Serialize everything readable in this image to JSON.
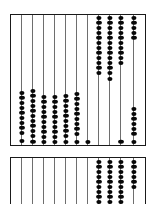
{
  "figure": {
    "instrument": "abacus",
    "ink_color": "#080808",
    "rod_color": "#6e6e6e",
    "frame_color": "#1a1a1a",
    "background_color": "#ffffff",
    "panel_count": 2,
    "rods_per_panel": 11
  },
  "panels": [
    {
      "name": "upper-abacus-frame",
      "label": "Upper abacus frame",
      "x": 10,
      "y": 14,
      "width": 136,
      "height": 132,
      "rod_count": 11,
      "rod_x": [
        20,
        31,
        42,
        53,
        64,
        75,
        86,
        97,
        108,
        119,
        132
      ],
      "rods": [
        {
          "index": 1,
          "bead_count": 10,
          "group": "lower",
          "beads_y": [
            92,
            97,
            102,
            107,
            112,
            117,
            122,
            127,
            132,
            140
          ]
        },
        {
          "index": 2,
          "bead_count": 11,
          "group": "lower",
          "beads_y": [
            90,
            95,
            100,
            105,
            110,
            115,
            120,
            125,
            130,
            135,
            141
          ]
        },
        {
          "index": 3,
          "bead_count": 10,
          "group": "lower",
          "beads_y": [
            96,
            101,
            106,
            111,
            116,
            121,
            126,
            131,
            136,
            141
          ]
        },
        {
          "index": 4,
          "bead_count": 10,
          "group": "lower",
          "beads_y": [
            96,
            101,
            106,
            111,
            116,
            121,
            126,
            131,
            136,
            141
          ]
        },
        {
          "index": 5,
          "bead_count": 10,
          "group": "lower",
          "beads_y": [
            95,
            100,
            105,
            110,
            115,
            120,
            125,
            130,
            135,
            141
          ]
        },
        {
          "index": 6,
          "bead_count": 10,
          "group": "lower",
          "beads_y": [
            93,
            98,
            103,
            108,
            113,
            118,
            123,
            128,
            133,
            141
          ]
        },
        {
          "index": 7,
          "bead_count": 1,
          "group": "bottom",
          "beads_y": [
            141
          ]
        },
        {
          "index": 8,
          "bead_count": 12,
          "group": "upper",
          "beads_y": [
            17,
            22,
            27,
            32,
            37,
            42,
            47,
            52,
            57,
            62,
            67,
            72
          ]
        },
        {
          "index": 9,
          "bead_count": 13,
          "group": "upper",
          "beads_y": [
            17,
            22,
            27,
            32,
            37,
            42,
            47,
            52,
            57,
            62,
            67,
            72,
            78
          ]
        },
        {
          "index": 10,
          "bead_count": 11,
          "group": "upper-and-bottom",
          "beads_y": [
            17,
            22,
            27,
            32,
            37,
            42,
            47,
            52,
            57,
            62,
            141
          ]
        },
        {
          "index": 11,
          "bead_count": 12,
          "group": "split",
          "beads_y": [
            17,
            22,
            27,
            32,
            37,
            108,
            113,
            118,
            123,
            128,
            133,
            141
          ]
        }
      ]
    },
    {
      "name": "lower-abacus-frame",
      "label": "Lower abacus frame (cropped)",
      "x": 10,
      "y": 157,
      "width": 136,
      "height": 56,
      "rod_count": 11,
      "rod_x": [
        20,
        31,
        42,
        53,
        64,
        75,
        86,
        97,
        108,
        119,
        132
      ],
      "rods": [
        {
          "index": 1,
          "bead_count": 0,
          "group": "empty",
          "beads_y": []
        },
        {
          "index": 2,
          "bead_count": 0,
          "group": "empty",
          "beads_y": []
        },
        {
          "index": 3,
          "bead_count": 0,
          "group": "empty",
          "beads_y": []
        },
        {
          "index": 4,
          "bead_count": 0,
          "group": "empty",
          "beads_y": []
        },
        {
          "index": 5,
          "bead_count": 0,
          "group": "empty",
          "beads_y": []
        },
        {
          "index": 6,
          "bead_count": 0,
          "group": "empty",
          "beads_y": []
        },
        {
          "index": 7,
          "bead_count": 0,
          "group": "empty",
          "beads_y": []
        },
        {
          "index": 8,
          "bead_count": 10,
          "group": "upper",
          "beads_y": [
            161,
            166,
            171,
            176,
            181,
            186,
            191,
            196,
            201,
            206
          ]
        },
        {
          "index": 9,
          "bead_count": 10,
          "group": "upper",
          "beads_y": [
            161,
            166,
            171,
            176,
            181,
            186,
            191,
            196,
            201,
            206
          ]
        },
        {
          "index": 10,
          "bead_count": 10,
          "group": "upper",
          "beads_y": [
            161,
            166,
            171,
            176,
            181,
            186,
            191,
            196,
            201,
            206
          ]
        },
        {
          "index": 11,
          "bead_count": 6,
          "group": "upper",
          "beads_y": [
            161,
            166,
            171,
            176,
            181,
            186
          ]
        }
      ]
    }
  ]
}
